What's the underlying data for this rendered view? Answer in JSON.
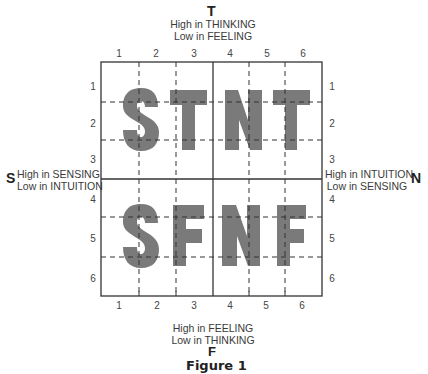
{
  "poles": {
    "top": {
      "letter": "T",
      "line1": "High in THINKING",
      "line2": "Low in FEELING"
    },
    "bottom": {
      "letter": "F",
      "line1": "High in FEELING",
      "line2": "Low in THINKING"
    },
    "left": {
      "letter": "S",
      "line1": "High in SENSING",
      "line2": "Low in INTUITION"
    },
    "right": {
      "letter": "N",
      "line1": "High in INTUITION",
      "line2": "Low in SENSING"
    }
  },
  "axis": {
    "columns": [
      "1",
      "2",
      "3",
      "4",
      "5",
      "6"
    ],
    "rows": [
      "1",
      "2",
      "3",
      "4",
      "5",
      "6"
    ]
  },
  "quadrants": {
    "top_left": "ST",
    "top_right": "NT",
    "bottom_left": "SF",
    "bottom_right": "NF"
  },
  "letter_color": "#7a7a7a",
  "caption": "Figure 1"
}
